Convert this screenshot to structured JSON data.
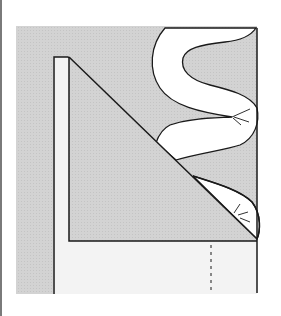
{
  "diagram": {
    "colors": {
      "background": "#ffffff",
      "fabric_shade": "#d0d0d0",
      "fabric_light": "#f3f3f3",
      "fold_white": "#ffffff",
      "outline": "#1a1a1a",
      "left_border": "#7a7a7a"
    },
    "elements": {
      "shaded_fabric": "Shaded fabric panel",
      "hem_strip": "Folded hem strip (left)",
      "triangle_flap": "Diagonal mitered flap",
      "bottom_band": "Bottom hem band",
      "wavy_fold": "Wavy folded fabric edge",
      "fold_lower": "Lower curled fold",
      "fold_line": "Dashed fold line",
      "stitch_marks_upper": "Stitch marks (upper)",
      "stitch_marks_lower": "Stitch marks (lower)"
    }
  }
}
